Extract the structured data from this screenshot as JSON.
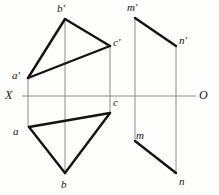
{
  "figure": {
    "kind": "descriptive-geometry-projection-drawing",
    "canvas": {
      "width": 219,
      "height": 195
    },
    "background_color": "#fdfdfc",
    "ink_color": "#141414",
    "thin_line_color": "#8c8c8c",
    "axis": {
      "name": "XO-axis",
      "left_label": "X",
      "right_label": "O",
      "y": 96,
      "x_start": 22,
      "x_end": 196,
      "left_label_pos": {
        "x": 5,
        "y": 89
      },
      "right_label_pos": {
        "x": 199,
        "y": 89
      },
      "color": "#8c8c8c",
      "width": 1
    },
    "vertices": [
      {
        "id": "a-prime",
        "label": "a'",
        "x": 28,
        "y": 78,
        "label_x": 12,
        "label_y": 70
      },
      {
        "id": "b-prime",
        "label": "b'",
        "x": 65,
        "y": 19,
        "label_x": 57,
        "label_y": 3
      },
      {
        "id": "c-prime",
        "label": "c'",
        "x": 110,
        "y": 46,
        "label_x": 113,
        "label_y": 37
      },
      {
        "id": "a",
        "label": "a",
        "x": 29,
        "y": 127,
        "label_x": 13,
        "label_y": 126
      },
      {
        "id": "b",
        "label": "b",
        "x": 65,
        "y": 173,
        "label_x": 61,
        "label_y": 179
      },
      {
        "id": "c",
        "label": "c",
        "x": 110,
        "y": 113,
        "label_x": 113,
        "label_y": 97
      },
      {
        "id": "m-prime",
        "label": "m'",
        "x": 135,
        "y": 18,
        "label_x": 127,
        "label_y": 2
      },
      {
        "id": "n-prime",
        "label": "n'",
        "x": 176,
        "y": 46,
        "label_x": 179,
        "label_y": 35
      },
      {
        "id": "m",
        "label": "m",
        "x": 135,
        "y": 141,
        "label_x": 136,
        "label_y": 130
      },
      {
        "id": "n",
        "label": "n",
        "x": 176,
        "y": 173,
        "label_x": 179,
        "label_y": 176
      }
    ],
    "thick_edges": [
      {
        "id": "edge-aprime-bprime",
        "from": "a-prime",
        "to": "b-prime"
      },
      {
        "id": "edge-bprime-cprime",
        "from": "b-prime",
        "to": "c-prime"
      },
      {
        "id": "edge-cprime-aprime",
        "from": "c-prime",
        "to": "a-prime"
      },
      {
        "id": "edge-a-b",
        "from": "a",
        "to": "b"
      },
      {
        "id": "edge-b-c",
        "from": "b",
        "to": "c"
      },
      {
        "id": "edge-c-a",
        "from": "c",
        "to": "a"
      },
      {
        "id": "edge-mprime-nprime",
        "from": "m-prime",
        "to": "n-prime"
      },
      {
        "id": "edge-m-n",
        "from": "m",
        "to": "n"
      }
    ],
    "thin_projection_lines": [
      {
        "id": "proj-a",
        "x": 28,
        "y1": 78,
        "y2": 127
      },
      {
        "id": "proj-b",
        "x": 65,
        "y1": 19,
        "y2": 173
      },
      {
        "id": "proj-c",
        "x": 110,
        "y1": 46,
        "y2": 113
      },
      {
        "id": "proj-m",
        "x": 135,
        "y1": 18,
        "y2": 141
      },
      {
        "id": "proj-n",
        "x": 176,
        "y1": 46,
        "y2": 173
      }
    ],
    "stroke_widths": {
      "thick": 2.4,
      "thin": 1
    }
  }
}
